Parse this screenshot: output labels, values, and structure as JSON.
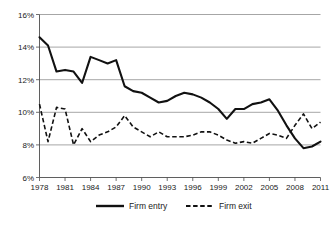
{
  "chart_data": {
    "type": "line",
    "title": "",
    "subtitle": "",
    "xlabel": "",
    "ylabel": "",
    "grid": "horizontal",
    "legend_position": "bottom",
    "xlim": [
      1978,
      2011
    ],
    "ylim": [
      6,
      16
    ],
    "y_tick_step": 2,
    "x_tick_step": 3,
    "ytick_labels": [
      "16%",
      "14%",
      "12%",
      "10%",
      "8%",
      "6%"
    ],
    "ytick_values": [
      16,
      14,
      12,
      10,
      8,
      6
    ],
    "xtick_labels": [
      "1978",
      "1981",
      "1984",
      "1987",
      "1990",
      "1993",
      "1996",
      "1999",
      "2002",
      "2005",
      "2008",
      "2011"
    ],
    "xtick_values": [
      1978,
      1981,
      1984,
      1987,
      1990,
      1993,
      1996,
      1999,
      2002,
      2005,
      2008,
      2011
    ],
    "x": [
      1978,
      1979,
      1980,
      1981,
      1982,
      1983,
      1984,
      1985,
      1986,
      1987,
      1988,
      1989,
      1990,
      1991,
      1992,
      1993,
      1994,
      1995,
      1996,
      1997,
      1998,
      1999,
      2000,
      2001,
      2002,
      2003,
      2004,
      2005,
      2006,
      2007,
      2008,
      2009,
      2010,
      2011
    ],
    "series": [
      {
        "name": "Firm entry",
        "style": "solid",
        "color": "#111111",
        "values": [
          14.6,
          14.1,
          12.5,
          12.6,
          12.5,
          11.8,
          13.4,
          13.2,
          13.0,
          13.2,
          11.6,
          11.3,
          11.2,
          10.9,
          10.6,
          10.7,
          11.0,
          11.2,
          11.1,
          10.9,
          10.6,
          10.2,
          9.6,
          10.2,
          10.2,
          10.5,
          10.6,
          10.8,
          10.1,
          9.2,
          8.4,
          7.8,
          7.9,
          8.2
        ]
      },
      {
        "name": "Firm exit",
        "style": "dashed",
        "color": "#111111",
        "values": [
          10.5,
          8.2,
          10.3,
          10.2,
          8.0,
          9.0,
          8.2,
          8.6,
          8.8,
          9.1,
          9.8,
          9.1,
          8.8,
          8.5,
          8.8,
          8.5,
          8.5,
          8.5,
          8.6,
          8.8,
          8.8,
          8.6,
          8.3,
          8.1,
          8.2,
          8.1,
          8.4,
          8.7,
          8.6,
          8.4,
          9.2,
          9.9,
          9.0,
          9.4
        ]
      }
    ]
  },
  "legend": {
    "entries": [
      {
        "label": "Firm entry",
        "style": "solid"
      },
      {
        "label": "Firm exit",
        "style": "dashed"
      }
    ]
  }
}
